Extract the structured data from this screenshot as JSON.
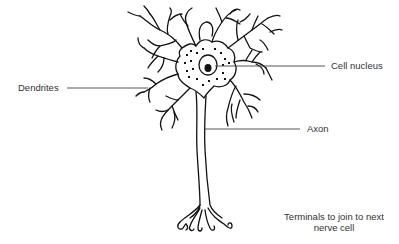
{
  "diagram": {
    "type": "labeled-illustration",
    "colors": {
      "ink": "#111111",
      "label_text": "#333333",
      "leader_line": "#444444",
      "background": "#ffffff"
    },
    "labels": {
      "dendrites": "Dendrites",
      "cell_nucleus": "Cell nucleus",
      "axon": "Axon",
      "terminals_line1": "Terminals to join to next",
      "terminals_line2": "nerve cell"
    },
    "parts": [
      {
        "id": "dendrites",
        "label": "Dendrites",
        "points_to": "branching dendrites on left of cell body"
      },
      {
        "id": "cell-nucleus",
        "label": "Cell nucleus",
        "points_to": "nucleus inside cell body"
      },
      {
        "id": "axon",
        "label": "Axon",
        "points_to": "long axon fibre"
      },
      {
        "id": "terminals",
        "label": "Terminals to join to next nerve cell",
        "points_to": "axon terminals at bottom"
      }
    ]
  }
}
